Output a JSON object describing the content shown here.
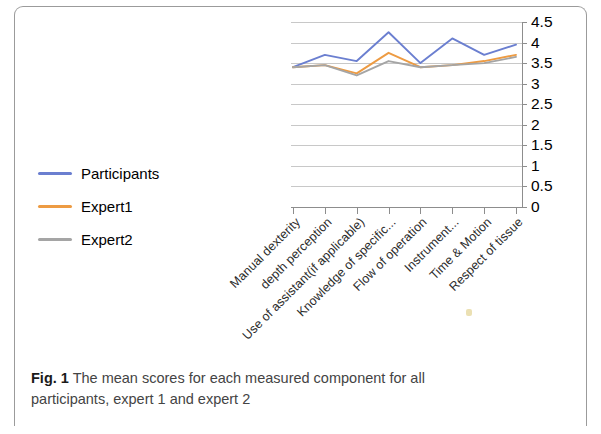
{
  "figure": {
    "caption_prefix": "Fig. 1",
    "caption_text": " The mean scores for each measured component for all participants, expert 1 and expert 2"
  },
  "legend": {
    "position": "left",
    "items": [
      {
        "label": "Participants",
        "color": "#6b7fd0"
      },
      {
        "label": "Expert1",
        "color": "#ed9b43"
      },
      {
        "label": "Expert2",
        "color": "#a5a5a5"
      }
    ]
  },
  "axis": {
    "y_ticks": [
      "4.5",
      "4",
      "3.5",
      "3",
      "2.5",
      "2",
      "1.5",
      "1",
      "0.5",
      "0"
    ],
    "y_label_position": "right"
  },
  "chart_data": {
    "type": "line",
    "title": "",
    "xlabel": "",
    "ylabel": "",
    "ylim": [
      0,
      4.5
    ],
    "ytick_step": 0.5,
    "grid": true,
    "legend_position": "left",
    "categories": [
      "Manual dexterity",
      "depth perception",
      "Use of assistant(if applicable)",
      "Knowledge of specific...",
      "Flow of operation",
      "Instrument...",
      "Time & Motion",
      "Respect of tissue"
    ],
    "series": [
      {
        "name": "Participants",
        "color": "#6b7fd0",
        "values": [
          3.4,
          3.7,
          3.55,
          4.25,
          3.5,
          4.1,
          3.7,
          3.95
        ]
      },
      {
        "name": "Expert1",
        "color": "#ed9b43",
        "values": [
          3.4,
          3.45,
          3.25,
          3.75,
          3.4,
          3.45,
          3.55,
          3.7
        ]
      },
      {
        "name": "Expert2",
        "color": "#a5a5a5",
        "values": [
          3.4,
          3.45,
          3.2,
          3.55,
          3.4,
          3.45,
          3.5,
          3.65
        ]
      }
    ]
  }
}
